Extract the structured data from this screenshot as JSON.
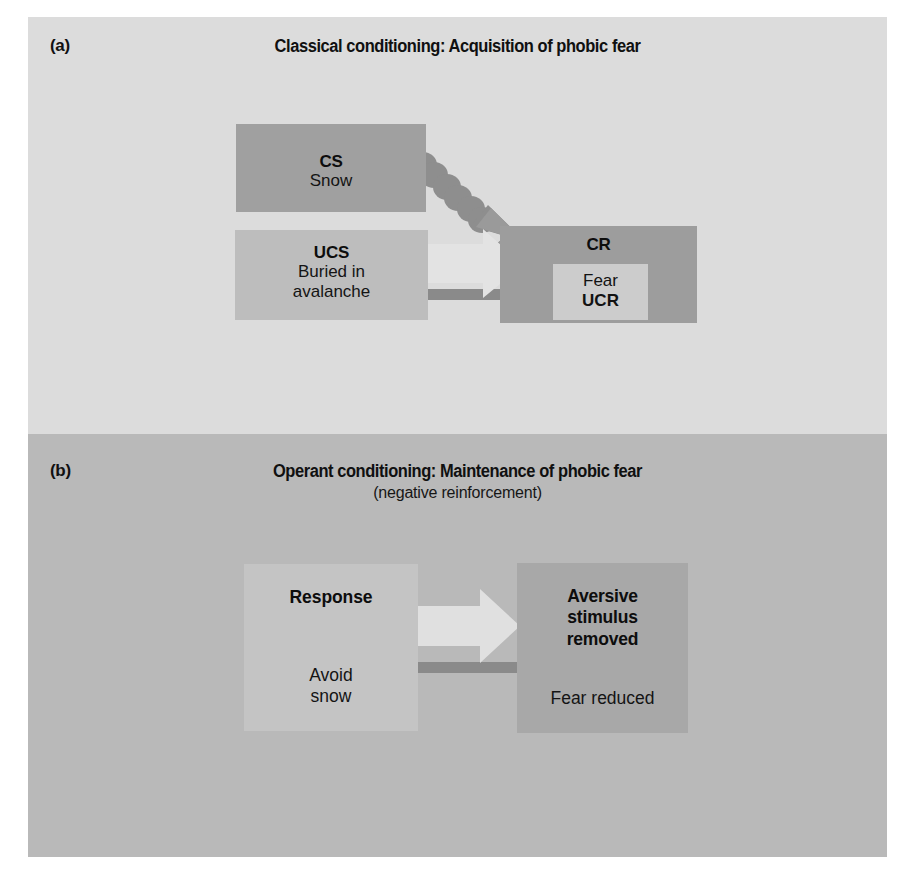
{
  "figure": {
    "panels": [
      {
        "letter": "(a)",
        "title": "Classical conditioning: Acquisition of phobic fear",
        "subtitle": "",
        "background_color": "#dcdcdc",
        "boxes": [
          {
            "name": "cs",
            "title": "CS",
            "body": "Snow",
            "color": "#a0a0a0"
          },
          {
            "name": "ucs",
            "title": "UCS",
            "body": "Buried in avalanche",
            "body_line1": "Buried in",
            "body_line2": "avalanche",
            "color": "#bdbdbd"
          },
          {
            "name": "cr",
            "title": "CR",
            "inner_line1": "Fear",
            "inner_line2": "UCR",
            "color": "#9d9d9d",
            "inner_color": "#cccccc"
          }
        ],
        "arrows": [
          {
            "name": "cs-to-cr-dotted-arrow",
            "style": "dotted-diagonal",
            "from": "cs",
            "to": "cr",
            "color": "#8e8e8e"
          },
          {
            "name": "ucs-to-cr-arrow",
            "style": "block-arrow-right",
            "from": "ucs",
            "to": "cr",
            "color": "#e3e3e3",
            "shadow_color": "#8a8a8a"
          }
        ]
      },
      {
        "letter": "(b)",
        "title": "Operant conditioning: Maintenance of phobic fear",
        "subtitle": "(negative reinforcement)",
        "background_color": "#b9b9b9",
        "boxes": [
          {
            "name": "response",
            "title": "Response",
            "body": "Avoid snow",
            "body_line1": "Avoid",
            "body_line2": "snow",
            "color": "#c4c4c4"
          },
          {
            "name": "aversive-stimulus-removed",
            "title": "Aversive stimulus removed",
            "title_line1": "Aversive",
            "title_line2": "stimulus",
            "title_line3": "removed",
            "body": "Fear reduced",
            "color": "#a8a8a8"
          }
        ],
        "arrows": [
          {
            "name": "response-to-aversive-arrow",
            "style": "block-arrow-right",
            "from": "response",
            "to": "aversive-stimulus-removed",
            "color": "#e0e0e0",
            "shadow_color": "#8a8a8a"
          }
        ]
      }
    ]
  }
}
